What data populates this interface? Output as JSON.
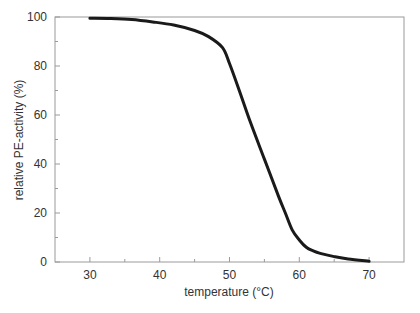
{
  "chart_data": {
    "type": "line",
    "title": "",
    "xlabel": "temperature (°C)",
    "ylabel": "relative PE-activity (%)",
    "xlim": [
      25,
      75
    ],
    "ylim": [
      0,
      100
    ],
    "x_ticks": [
      30,
      40,
      50,
      60,
      70
    ],
    "y_ticks": [
      0,
      20,
      40,
      60,
      80,
      100
    ],
    "grid": false,
    "legend": null,
    "series": [
      {
        "name": "relative PE-activity",
        "color": "#1a1a1a",
        "x": [
          30,
          33,
          36,
          39,
          42,
          45,
          47,
          49,
          50,
          51.4,
          53,
          55,
          57,
          58,
          59,
          60,
          61,
          62,
          63,
          65,
          67,
          70
        ],
        "y": [
          99.5,
          99.4,
          99,
          98,
          96.7,
          94.5,
          92,
          87.5,
          81,
          70,
          57,
          42,
          27,
          20,
          13,
          9,
          6,
          4.5,
          3.5,
          2.2,
          1.2,
          0.3
        ]
      }
    ]
  }
}
